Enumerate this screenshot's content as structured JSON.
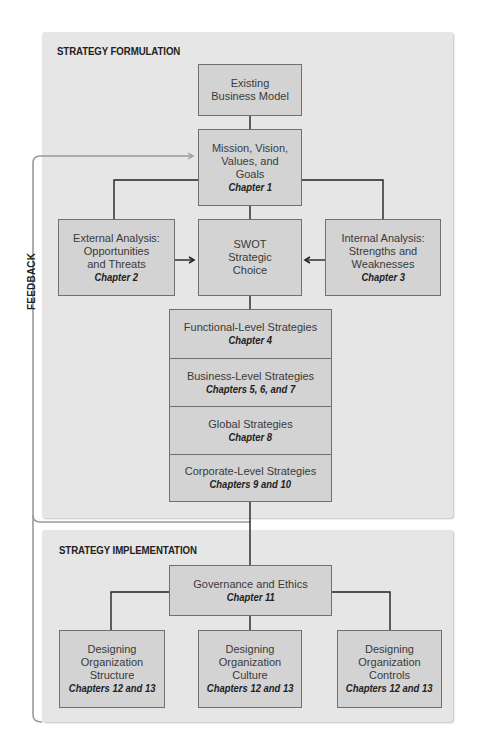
{
  "diagram": {
    "feedback_label": "FEEDBACK",
    "formulation": {
      "title": "STRATEGY FORMULATION",
      "existing_model": {
        "label": "Existing\nBusiness Model"
      },
      "mission": {
        "label": "Mission, Vision,\nValues, and\nGoals",
        "chapter": "Chapter 1"
      },
      "external": {
        "label": "External Analysis:\nOpportunities\nand Threats",
        "chapter": "Chapter 2"
      },
      "swot": {
        "label": "SWOT\nStrategic\nChoice"
      },
      "internal": {
        "label": "Internal Analysis:\nStrengths and\nWeaknesses",
        "chapter": "Chapter 3"
      },
      "strategies": [
        {
          "label": "Functional-Level Strategies",
          "chapter": "Chapter 4"
        },
        {
          "label": "Business-Level Strategies",
          "chapter": "Chapters 5, 6, and 7"
        },
        {
          "label": "Global Strategies",
          "chapter": "Chapter 8"
        },
        {
          "label": "Corporate-Level Strategies",
          "chapter": "Chapters 9 and 10"
        }
      ]
    },
    "implementation": {
      "title": "STRATEGY IMPLEMENTATION",
      "governance": {
        "label": "Governance and Ethics",
        "chapter": "Chapter 11"
      },
      "structure": {
        "label": "Designing\nOrganization\nStructure",
        "chapter": "Chapters 12 and 13"
      },
      "culture": {
        "label": "Designing\nOrganization\nCulture",
        "chapter": "Chapters 12 and 13"
      },
      "controls": {
        "label": "Designing\nOrganization\nControls",
        "chapter": "Chapters 12 and 13"
      }
    },
    "colors": {
      "panel": "#e6e6e6",
      "box": "#d3d3d3",
      "box_border": "#707070",
      "arrow": "#222222",
      "feedback_line": "#9a9a9a"
    }
  }
}
